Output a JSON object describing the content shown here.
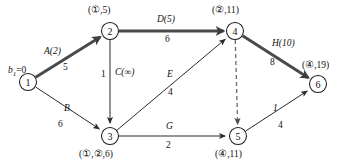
{
  "figure": {
    "type": "network-flow-diagram",
    "background": "#ffffff",
    "line_color": "#2b2b2b",
    "bold_color": "#4a4a4a",
    "dashed_color": "#6b6b6b"
  },
  "nodes": [
    {
      "id": "1",
      "num": "1",
      "cx": 28,
      "cy": 82,
      "r": 8.5,
      "tag": "",
      "tag_x": 0,
      "tag_y": 0
    },
    {
      "id": "2",
      "num": "2",
      "cx": 110,
      "cy": 31,
      "r": 8.5,
      "tag": "(①,5)",
      "tag_x": 88,
      "tag_y": 6
    },
    {
      "id": "3",
      "num": "3",
      "cx": 110,
      "cy": 136,
      "r": 8.5,
      "tag": "(①,②,6)",
      "tag_x": 79,
      "tag_y": 150
    },
    {
      "id": "4",
      "num": "4",
      "cx": 235,
      "cy": 31,
      "r": 8.5,
      "tag": "(②,11)",
      "tag_x": 212,
      "tag_y": 6
    },
    {
      "id": "5",
      "num": "5",
      "cx": 238,
      "cy": 136,
      "r": 8.5,
      "tag": "(④,11)",
      "tag_x": 215,
      "tag_y": 150
    },
    {
      "id": "6",
      "num": "6",
      "cx": 318,
      "cy": 84,
      "r": 8.5,
      "tag": "(④,19)",
      "tag_x": 302,
      "tag_y": 61
    }
  ],
  "source_label": {
    "base": "b",
    "subscript": "1",
    "suffix": "=0",
    "x": 8,
    "y": 66
  },
  "edges": [
    {
      "id": "e-1-2",
      "from": "1",
      "to": "2",
      "style": "bold",
      "arrow": true,
      "name": "A(2)",
      "name_x": 44,
      "name_y": 47,
      "value": "5",
      "value_x": 63,
      "value_y": 63
    },
    {
      "id": "e-1-3",
      "from": "1",
      "to": "3",
      "style": "thin",
      "arrow": true,
      "name": "B",
      "name_x": 64,
      "name_y": 104,
      "value": "6",
      "value_x": 58,
      "value_y": 120
    },
    {
      "id": "e-2-3",
      "from": "2",
      "to": "3",
      "style": "thin",
      "arrow": true,
      "name": "C(∞)",
      "name_x": 115,
      "name_y": 68,
      "value": "1",
      "value_x": 101,
      "value_y": 70
    },
    {
      "id": "e-2-4",
      "from": "2",
      "to": "4",
      "style": "bold",
      "arrow": true,
      "name": "D(5)",
      "name_x": 157,
      "name_y": 15,
      "value": "6",
      "value_x": 165,
      "value_y": 35
    },
    {
      "id": "e-3-4",
      "from": "3",
      "to": "4",
      "style": "thin",
      "arrow": true,
      "name": "E",
      "name_x": 167,
      "name_y": 70,
      "value": "4",
      "value_x": 168,
      "value_y": 88
    },
    {
      "id": "e-3-5",
      "from": "3",
      "to": "5",
      "style": "thin",
      "arrow": true,
      "name": "G",
      "name_x": 166,
      "name_y": 122,
      "value": "2",
      "value_x": 166,
      "value_y": 141
    },
    {
      "id": "e-4-5",
      "from": "4",
      "to": "5",
      "style": "dashed",
      "arrow": true,
      "name": "",
      "name_x": 0,
      "name_y": 0,
      "value": "",
      "value_x": 0,
      "value_y": 0
    },
    {
      "id": "e-4-6",
      "from": "4",
      "to": "6",
      "style": "bold",
      "arrow": true,
      "name": "H(10)",
      "name_x": 272,
      "name_y": 39,
      "value": "8",
      "value_x": 270,
      "value_y": 58
    },
    {
      "id": "e-5-6",
      "from": "5",
      "to": "6",
      "style": "thin",
      "arrow": true,
      "name": "1",
      "name_x": 273,
      "name_y": 104,
      "value": "4",
      "value_x": 278,
      "value_y": 121
    }
  ]
}
